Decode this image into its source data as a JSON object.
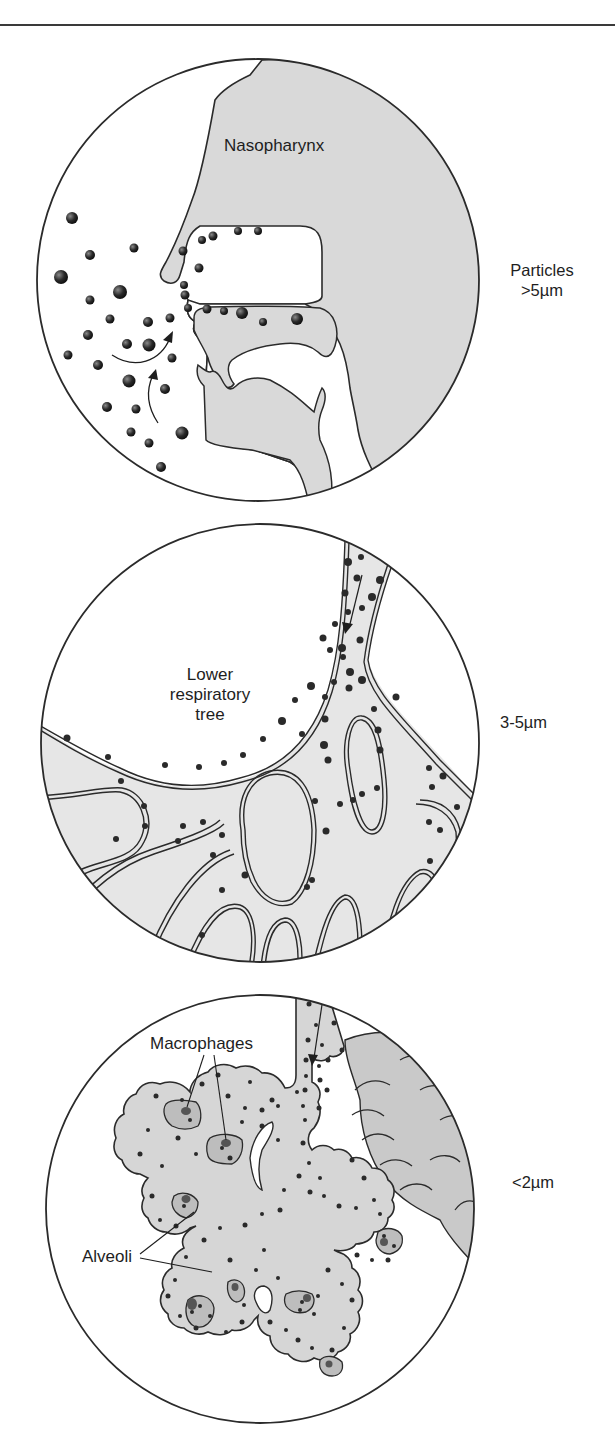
{
  "figure": {
    "panels": [
      {
        "id": "upper",
        "region_label": "Nasopharynx",
        "size_label_line1": "Particles",
        "size_label_line2": ">5µm"
      },
      {
        "id": "middle",
        "region_label_line1": "Lower",
        "region_label_line2": "respiratory",
        "region_label_line3": "tree",
        "size_label": "3-5µm"
      },
      {
        "id": "lower",
        "callout_macrophages": "Macrophages",
        "callout_alveoli": "Alveoli",
        "size_label": "<2µm"
      }
    ],
    "colors": {
      "tissue_fill": "#d9d9d9",
      "airway_fill": "#e6e6e6",
      "outline": "#2b2b2b",
      "particle": "#2a2a2a"
    }
  }
}
